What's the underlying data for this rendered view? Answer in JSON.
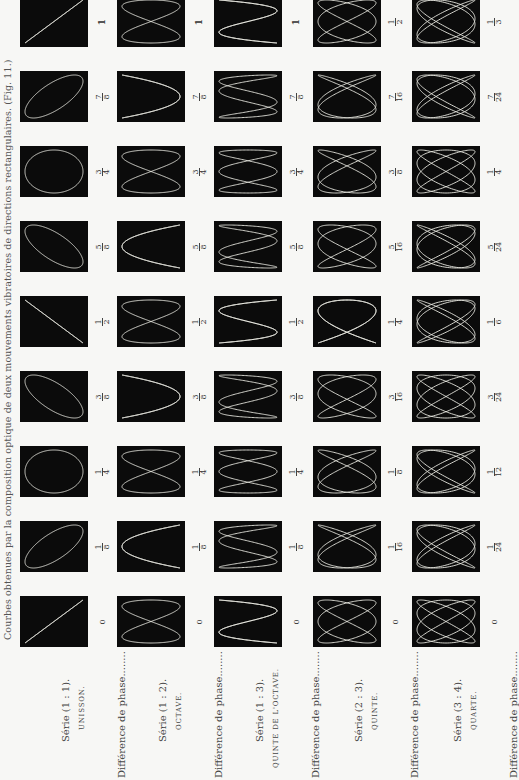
{
  "title": "Courbes obtenues par la composition optique de deux mouvements vibratoires de directions rectangulaires. (Fig. 11.)",
  "phase_label": "Différence de phase........",
  "columns": [
    {
      "serie": "Série (1 : 1).",
      "name": "UNISSON.",
      "ratio": [
        1,
        1
      ],
      "phases": [
        "0",
        "1/8",
        "1/4",
        "3/8",
        "1/2",
        "5/8",
        "3/4",
        "7/8",
        "1"
      ],
      "phase_values": [
        0,
        0.125,
        0.25,
        0.375,
        0.5,
        0.625,
        0.75,
        0.875,
        1
      ]
    },
    {
      "serie": "Série (1 : 2).",
      "name": "OCTAVE.",
      "ratio": [
        1,
        2
      ],
      "phases": [
        "0",
        "1/8",
        "1/4",
        "3/8",
        "1/2",
        "5/8",
        "3/4",
        "7/8",
        "1"
      ],
      "phase_values": [
        0,
        0.125,
        0.25,
        0.375,
        0.5,
        0.625,
        0.75,
        0.875,
        1
      ]
    },
    {
      "serie": "Série (1 : 3).",
      "name": "QUINTE DE L'OCTAVE.",
      "ratio": [
        1,
        3
      ],
      "phases": [
        "0",
        "1/8",
        "1/4",
        "3/8",
        "1/2",
        "5/8",
        "3/4",
        "7/8",
        "1"
      ],
      "phase_values": [
        0,
        0.125,
        0.25,
        0.375,
        0.5,
        0.625,
        0.75,
        0.875,
        1
      ]
    },
    {
      "serie": "Série (2 : 3).",
      "name": "QUINTE.",
      "ratio": [
        2,
        3
      ],
      "phases": [
        "0",
        "1/16",
        "1/8",
        "3/16",
        "1/4",
        "5/16",
        "3/8",
        "7/16",
        "1/2"
      ],
      "phase_values": [
        0,
        0.0625,
        0.125,
        0.1875,
        0.25,
        0.3125,
        0.375,
        0.4375,
        0.5
      ]
    },
    {
      "serie": "Série (3 : 4).",
      "name": "QUARTE.",
      "ratio": [
        3,
        4
      ],
      "phases": [
        "0",
        "1/24",
        "1/12",
        "3/24",
        "1/6",
        "5/24",
        "1/4",
        "7/24",
        "1/3"
      ],
      "phase_values": [
        0,
        0.0417,
        0.0833,
        0.125,
        0.1667,
        0.2083,
        0.25,
        0.2917,
        0.3333
      ]
    }
  ],
  "colors": {
    "figure_bg": "#0b0b0b",
    "curve": "#e8e8e0",
    "page": "#f7f7f5"
  }
}
